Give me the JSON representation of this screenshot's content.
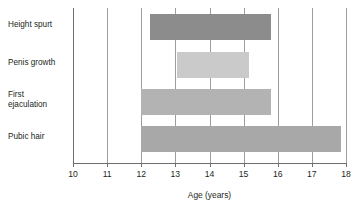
{
  "chart_data": {
    "type": "bar",
    "orientation": "horizontal",
    "subtype": "range-bar",
    "title": "",
    "xlabel": "Age (years)",
    "ylabel": "",
    "xlim": [
      10,
      18
    ],
    "xticks": [
      10,
      11,
      12,
      13,
      14,
      15,
      16,
      17,
      18
    ],
    "xtick_labels": [
      "10",
      "11",
      "12",
      "13",
      "14",
      "15",
      "16",
      "17",
      "18"
    ],
    "grid": true,
    "grid_axis": "x",
    "legend": false,
    "categories": [
      "Height spurt",
      "Penis growth",
      "First\nejaculation",
      "Pubic hair"
    ],
    "series": [
      {
        "name": "Age range",
        "bars": [
          {
            "category": "Height spurt",
            "start": 12.25,
            "end": 15.8,
            "color": "#8c8c8c"
          },
          {
            "category": "Penis growth",
            "start": 13.05,
            "end": 15.15,
            "color": "#cacaca"
          },
          {
            "category": "First ejaculation",
            "start": 12.0,
            "end": 15.8,
            "color": "#b3b3b3"
          },
          {
            "category": "Pubic hair",
            "start": 12.0,
            "end": 17.85,
            "color": "#a8a8a8"
          }
        ]
      }
    ]
  },
  "axis": {
    "title": "Age (years)"
  },
  "labels": {
    "height_spurt": "Height spurt",
    "penis_growth": "Penis growth",
    "first_ejaculation": "First\nejaculation",
    "pubic_hair": "Pubic hair"
  },
  "colors": {
    "gridline": "#9d9d9d",
    "axis": "#6e6e6e",
    "text": "#231f20",
    "background": "#ffffff"
  }
}
